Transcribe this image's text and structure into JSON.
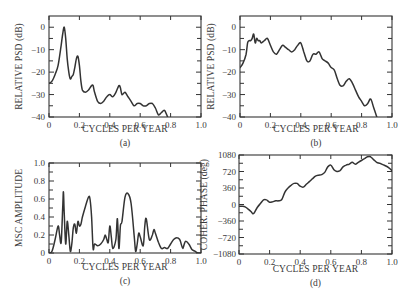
{
  "chart_data": [
    {
      "id": "a",
      "type": "line",
      "caption": "(a)",
      "xlabel": "CYCLES PER YEAR",
      "ylabel": "RELATIVE PSD (dB)",
      "xlim": [
        0,
        1.0
      ],
      "ylim": [
        -40,
        5
      ],
      "xticks": [
        0,
        0.2,
        0.4,
        0.6,
        0.8,
        1.0
      ],
      "xtick_labels": [
        "0",
        "0.2",
        "0.4",
        "0.6",
        "0.8",
        "1.0"
      ],
      "yticks": [
        0,
        -10,
        -20,
        -30,
        -40
      ],
      "ytick_labels": [
        "0",
        "-10",
        "-20",
        "-30",
        "-40"
      ],
      "x": [
        0,
        0.02,
        0.04,
        0.06,
        0.08,
        0.09,
        0.1,
        0.11,
        0.12,
        0.13,
        0.14,
        0.15,
        0.16,
        0.17,
        0.18,
        0.19,
        0.2,
        0.21,
        0.22,
        0.24,
        0.26,
        0.28,
        0.29,
        0.3,
        0.32,
        0.34,
        0.36,
        0.38,
        0.4,
        0.42,
        0.44,
        0.46,
        0.47,
        0.48,
        0.5,
        0.52,
        0.54,
        0.56,
        0.58,
        0.6,
        0.62,
        0.64,
        0.66,
        0.68,
        0.7,
        0.72,
        0.74,
        0.76,
        0.78
      ],
      "y": [
        -25,
        -24,
        -21,
        -17,
        -8,
        -3,
        0,
        -5,
        -14,
        -20,
        -23,
        -22,
        -21,
        -18,
        -14,
        -13,
        -17,
        -24,
        -28,
        -29,
        -28,
        -26,
        -26,
        -29,
        -33,
        -34,
        -33,
        -31,
        -30,
        -31,
        -29,
        -26,
        -27,
        -30,
        -29,
        -31,
        -33,
        -35,
        -34,
        -34,
        -35,
        -35,
        -34,
        -34,
        -36,
        -39,
        -38,
        -37,
        -40
      ]
    },
    {
      "id": "b",
      "type": "line",
      "caption": "(b)",
      "xlabel": "CYCLES PER YEAR",
      "ylabel": "RELATIVE PSD (dB)",
      "xlim": [
        0,
        1.0
      ],
      "ylim": [
        -40,
        5
      ],
      "xticks": [
        0,
        0.2,
        0.4,
        0.6,
        0.8,
        1.0
      ],
      "xtick_labels": [
        "0",
        "0.2",
        "0.4",
        "0.6",
        "0.8",
        "1.0"
      ],
      "yticks": [
        0,
        -10,
        -20,
        -30,
        -40
      ],
      "ytick_labels": [
        "0",
        "-10",
        "-20",
        "-30",
        "-40"
      ],
      "x": [
        0,
        0.02,
        0.04,
        0.05,
        0.06,
        0.07,
        0.08,
        0.09,
        0.1,
        0.11,
        0.12,
        0.13,
        0.14,
        0.16,
        0.18,
        0.2,
        0.22,
        0.24,
        0.26,
        0.28,
        0.3,
        0.32,
        0.34,
        0.36,
        0.38,
        0.4,
        0.42,
        0.44,
        0.46,
        0.48,
        0.5,
        0.52,
        0.54,
        0.56,
        0.58,
        0.6,
        0.62,
        0.64,
        0.66,
        0.68,
        0.7,
        0.72,
        0.74,
        0.76,
        0.78,
        0.8,
        0.82,
        0.84,
        0.86,
        0.88,
        0.9
      ],
      "y": [
        -18,
        -16,
        -12,
        -7,
        -6,
        -6,
        -5,
        -3,
        -7,
        -5,
        -6,
        -6,
        -7,
        -6,
        -5,
        -8,
        -11,
        -12,
        -10,
        -8,
        -9,
        -10,
        -11,
        -10,
        -8,
        -7,
        -11,
        -15,
        -15,
        -12,
        -12,
        -11,
        -14,
        -15,
        -16,
        -18,
        -19,
        -23,
        -26,
        -26,
        -24,
        -23,
        -25,
        -28,
        -31,
        -33,
        -35,
        -34,
        -32,
        -36,
        -40
      ]
    },
    {
      "id": "c",
      "type": "line",
      "caption": "(c)",
      "xlabel": "CYCLES PER YEAR",
      "ylabel": "MSC AMPLITUDE",
      "xlim": [
        0,
        1.0
      ],
      "ylim": [
        0,
        1.0
      ],
      "xticks": [
        0,
        0.2,
        0.4,
        0.6,
        0.8,
        1.0
      ],
      "xtick_labels": [
        "0",
        "0.2",
        "0.4",
        "0.6",
        "0.8",
        "1.0"
      ],
      "yticks": [
        0,
        0.2,
        0.4,
        0.6,
        0.8,
        1.0
      ],
      "ytick_labels": [
        "0",
        "0.2",
        "0.4",
        "0.6",
        "0.8",
        "1.0"
      ],
      "x": [
        0,
        0.02,
        0.04,
        0.06,
        0.07,
        0.08,
        0.09,
        0.095,
        0.1,
        0.11,
        0.12,
        0.13,
        0.14,
        0.15,
        0.16,
        0.17,
        0.18,
        0.19,
        0.2,
        0.21,
        0.22,
        0.24,
        0.26,
        0.27,
        0.28,
        0.29,
        0.3,
        0.32,
        0.34,
        0.36,
        0.37,
        0.38,
        0.39,
        0.4,
        0.41,
        0.42,
        0.44,
        0.45,
        0.46,
        0.47,
        0.48,
        0.5,
        0.52,
        0.54,
        0.56,
        0.57,
        0.58,
        0.59,
        0.6,
        0.62,
        0.63,
        0.64,
        0.66,
        0.68,
        0.69,
        0.7,
        0.72,
        0.74,
        0.76,
        0.78,
        0.8,
        0.82,
        0.84,
        0.86,
        0.87,
        0.88,
        0.89,
        0.9,
        0.92,
        0.94,
        0.96,
        0.98,
        1.0
      ],
      "y": [
        0,
        0.02,
        0.15,
        0.3,
        0.2,
        0.12,
        0.5,
        0.68,
        0.45,
        0.1,
        0.35,
        0.2,
        0.02,
        0.1,
        0.28,
        0.32,
        0.22,
        0.35,
        0.3,
        0.32,
        0.4,
        0.52,
        0.62,
        0.6,
        0.4,
        0.05,
        0.1,
        0.08,
        0.1,
        0.15,
        0.2,
        0.15,
        0.12,
        0.3,
        0.18,
        0.05,
        0.15,
        0.38,
        0.05,
        0.3,
        0.35,
        0.62,
        0.66,
        0.55,
        0.2,
        0.02,
        0.1,
        0.22,
        0.18,
        0.08,
        0.3,
        0.38,
        0.15,
        0.2,
        0.26,
        0.22,
        0.12,
        0.05,
        0.06,
        0.05,
        0.1,
        0.15,
        0.17,
        0.15,
        0.1,
        0.05,
        0.1,
        0.13,
        0.1,
        0.04,
        0.02,
        0.0,
        0.0
      ]
    },
    {
      "id": "d",
      "type": "line",
      "caption": "(d)",
      "xlabel": "CYCLES PER YEAR",
      "ylabel": "COHER. PHASE (deg)",
      "xlim": [
        0,
        1.0
      ],
      "ylim": [
        -1080,
        1080
      ],
      "xticks": [
        0,
        0.2,
        0.4,
        0.6,
        0.8,
        1.0
      ],
      "xtick_labels": [
        "0",
        "0.2",
        "0.4",
        "0.6",
        "0.8",
        "1.0"
      ],
      "yticks": [
        1080,
        720,
        360,
        0,
        -360,
        -720,
        -1080
      ],
      "ytick_labels": [
        "1080",
        "720",
        "360",
        "0",
        "-360",
        "-720",
        "-1080"
      ],
      "x": [
        0,
        0.02,
        0.04,
        0.06,
        0.08,
        0.09,
        0.1,
        0.12,
        0.14,
        0.16,
        0.18,
        0.2,
        0.22,
        0.24,
        0.26,
        0.28,
        0.3,
        0.32,
        0.34,
        0.36,
        0.38,
        0.4,
        0.42,
        0.44,
        0.46,
        0.48,
        0.5,
        0.52,
        0.54,
        0.56,
        0.58,
        0.6,
        0.62,
        0.64,
        0.66,
        0.68,
        0.7,
        0.72,
        0.74,
        0.76,
        0.78,
        0.8,
        0.82,
        0.84,
        0.86,
        0.88,
        0.9,
        0.92,
        0.94,
        0.96,
        0.98,
        1.0
      ],
      "y": [
        -40,
        -40,
        -50,
        -100,
        -160,
        -200,
        -180,
        -60,
        20,
        100,
        100,
        50,
        60,
        80,
        80,
        110,
        270,
        360,
        420,
        460,
        460,
        400,
        380,
        440,
        500,
        560,
        620,
        640,
        650,
        700,
        820,
        860,
        760,
        720,
        740,
        820,
        860,
        880,
        920,
        880,
        920,
        960,
        1000,
        1040,
        1040,
        980,
        920,
        900,
        870,
        840,
        800,
        740
      ]
    }
  ]
}
